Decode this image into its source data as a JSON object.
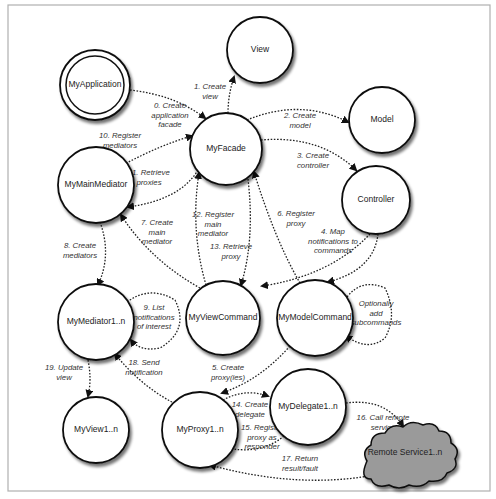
{
  "frame": {
    "x": 8,
    "y": 5,
    "width": 482,
    "height": 486,
    "stroke": "#b0b0b0"
  },
  "colors": {
    "node_stroke": "#111111",
    "node_fill": "#ffffff",
    "cloud_fill": "#9a9a9a",
    "edge": "#222222",
    "text": "#222222"
  },
  "nodes": [
    {
      "id": "view",
      "label": "View",
      "cx": 260,
      "cy": 50,
      "r": 33
    },
    {
      "id": "myapplication",
      "label": "MyApplication",
      "cx": 95,
      "cy": 85,
      "r": 35,
      "double": true
    },
    {
      "id": "myfacade",
      "label": "MyFacade",
      "cx": 226,
      "cy": 149,
      "r": 36
    },
    {
      "id": "model",
      "label": "Model",
      "cx": 382,
      "cy": 120,
      "r": 33
    },
    {
      "id": "mymainmediator",
      "label": "MyMainMediator",
      "cx": 96,
      "cy": 185,
      "r": 38
    },
    {
      "id": "controller",
      "label": "Controller",
      "cx": 376,
      "cy": 200,
      "r": 34
    },
    {
      "id": "mymediator",
      "label": "MyMediator1..n",
      "cx": 96,
      "cy": 322,
      "r": 38
    },
    {
      "id": "myviewcommand",
      "label": "MyViewCommand",
      "cx": 223,
      "cy": 318,
      "r": 37
    },
    {
      "id": "mymodelcommand",
      "label": "MyModelCommand",
      "cx": 315,
      "cy": 318,
      "r": 38
    },
    {
      "id": "myview",
      "label": "MyView1..n",
      "cx": 96,
      "cy": 430,
      "r": 33
    },
    {
      "id": "myproxy",
      "label": "MyProxy1..n",
      "cx": 200,
      "cy": 430,
      "r": 38
    },
    {
      "id": "mydelegate",
      "label": "MyDelegate1..n",
      "cx": 308,
      "cy": 407,
      "r": 38
    }
  ],
  "cloud": {
    "id": "remote-service",
    "label": "Remote Service1..n",
    "cx": 405,
    "cy": 453
  },
  "edges": [
    {
      "id": "e0",
      "d": "M130,90 Q175,95 205,118",
      "label": [
        "0. Create",
        "application",
        "facade"
      ],
      "lx": 170,
      "ly": 108
    },
    {
      "id": "e1",
      "d": "M228,113 Q228,95 234,77",
      "label": [
        "1. Create",
        "view"
      ],
      "lx": 210,
      "ly": 89
    },
    {
      "id": "e2",
      "d": "M247,120 Q300,98 348,122",
      "label": [
        "2. Create",
        "model"
      ],
      "lx": 300,
      "ly": 118
    },
    {
      "id": "e3",
      "d": "M261,140 Q320,135 356,170",
      "label": [
        "3. Create",
        "controller"
      ],
      "lx": 313,
      "ly": 158
    },
    {
      "id": "e4a",
      "d": "M370,234 Q330,276 262,286",
      "label": [
        "4. Map",
        "notifications to",
        "commands"
      ],
      "lx": 333,
      "ly": 234
    },
    {
      "id": "e4b",
      "d": "M378,234 Q374,270 328,282",
      "label": [],
      "lx": 0,
      "ly": 0
    },
    {
      "id": "e5",
      "d": "M290,346 Q260,380 222,393",
      "label": [
        "5. Create",
        "proxy(ies)"
      ],
      "lx": 228,
      "ly": 370
    },
    {
      "id": "e6",
      "d": "M300,283 Q275,240 254,172",
      "label": [
        "6. Register",
        "proxy"
      ],
      "lx": 296,
      "ly": 216
    },
    {
      "id": "e7",
      "d": "M200,288 Q150,260 121,215",
      "label": [
        "7. Create",
        "main",
        "mediator"
      ],
      "lx": 157,
      "ly": 225
    },
    {
      "id": "e8",
      "d": "M100,222 Q112,255 98,285",
      "label": [
        "8. Create",
        "mediators"
      ],
      "lx": 80,
      "ly": 248
    },
    {
      "id": "e9",
      "d": "M127,302 Q150,285 175,300 Q190,330 160,348 Q140,352 131,340",
      "label": [
        "9. List",
        "notifications",
        "of interest"
      ],
      "lx": 154,
      "ly": 310
    },
    {
      "id": "e10",
      "d": "M123,165 Q160,145 192,136",
      "label": [
        "10. Register",
        "mediators"
      ],
      "lx": 120,
      "ly": 138
    },
    {
      "id": "e11",
      "d": "M198,170 Q180,200 128,207",
      "label": [
        "11. Retrieve",
        "proxies"
      ],
      "lx": 149,
      "ly": 175
    },
    {
      "id": "e12",
      "d": "M206,285 Q190,230 199,173",
      "label": [
        "12. Register",
        "main",
        "mediator"
      ],
      "lx": 213,
      "ly": 217
    },
    {
      "id": "e13",
      "d": "M248,179 Q255,240 241,285",
      "label": [
        "13. Retrieve",
        "proxy"
      ],
      "lx": 231,
      "ly": 249
    },
    {
      "id": "e14",
      "d": "M223,400 Q245,388 268,396",
      "label": [
        "14. Create",
        "delegate"
      ],
      "lx": 250,
      "ly": 407
    },
    {
      "id": "e15",
      "d": "M284,436 Q260,456 222,447",
      "label": [
        "15. Register",
        "proxy as",
        "responder"
      ],
      "lx": 262,
      "ly": 430
    },
    {
      "id": "e16",
      "d": "M346,403 Q385,398 403,426",
      "label": [
        "16. Call remote",
        "service"
      ],
      "lx": 383,
      "ly": 420
    },
    {
      "id": "e17",
      "d": "M380,474 Q300,490 210,465",
      "label": [
        "17. Return",
        "result/fault"
      ],
      "lx": 300,
      "ly": 461
    },
    {
      "id": "e18",
      "d": "M172,402 Q140,385 115,354",
      "label": [
        "18. Send",
        "notification"
      ],
      "lx": 144,
      "ly": 365
    },
    {
      "id": "e19",
      "d": "M88,360 Q92,380 88,396",
      "label": [
        "19. Update",
        "view"
      ],
      "lx": 64,
      "ly": 370
    },
    {
      "id": "eopt",
      "d": "M347,297 Q362,278 385,288 Q398,315 385,338 Q368,352 346,336",
      "label": [
        "Optionally",
        "add",
        "subcommands"
      ],
      "lx": 376,
      "ly": 306
    }
  ]
}
